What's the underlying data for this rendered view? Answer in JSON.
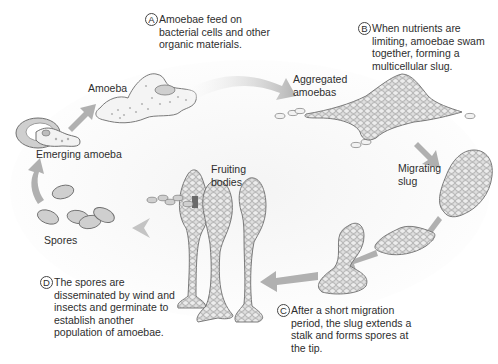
{
  "diagram": {
    "colors": {
      "background": "#ffffff",
      "arrow": "#a9a9a9",
      "cell_fill": "#dcdcdc",
      "cell_stroke": "#7a7a7a",
      "text": "#2e2e2e"
    },
    "stages": [
      {
        "id": "amoeba",
        "label": "Amoeba"
      },
      {
        "id": "aggregated",
        "label": "Aggregated amoebas",
        "lines": [
          "Aggregated",
          "amoebas"
        ]
      },
      {
        "id": "migrating-slug",
        "label": "Migrating slug",
        "lines": [
          "Migrating",
          "slug"
        ]
      },
      {
        "id": "fruiting-bodies",
        "label": "Fruiting bodies",
        "lines": [
          "Fruiting",
          "bodies"
        ]
      },
      {
        "id": "spores",
        "label": "Spores"
      },
      {
        "id": "emerging-amoeba",
        "label": "Emerging amoeba"
      }
    ],
    "notes": [
      {
        "letter": "A",
        "lines": [
          "Amoebae feed on",
          "bacterial cells and other",
          "organic materials."
        ]
      },
      {
        "letter": "B",
        "lines": [
          "When nutrients are",
          "limiting, amoebae swam",
          "together, forming a",
          "multicellular slug."
        ]
      },
      {
        "letter": "C",
        "lines": [
          "After a short migration",
          "period, the slug extends a",
          "stalk and forms spores at",
          "the tip."
        ]
      },
      {
        "letter": "D",
        "lines": [
          "The spores are",
          "disseminated by wind and",
          "insects and germinate to",
          "establish another",
          "population of amoebae."
        ]
      }
    ],
    "flow": [
      "emerging-amoeba",
      "amoeba",
      "aggregated",
      "migrating-slug",
      "culmination",
      "fruiting-bodies",
      "spores",
      "emerging-amoeba"
    ]
  }
}
